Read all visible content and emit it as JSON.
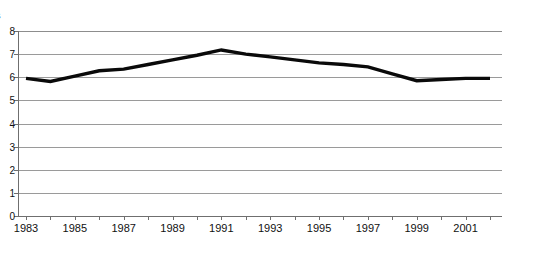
{
  "chart_data": {
    "type": "line",
    "title": "",
    "ylabel": "llions",
    "xlabel": "",
    "grid": true,
    "legend": false,
    "xlim": [
      1983,
      2002
    ],
    "ylim": [
      0,
      8
    ],
    "x": [
      1983,
      1984,
      1985,
      1986,
      1987,
      1988,
      1989,
      1990,
      1991,
      1992,
      1993,
      1994,
      1995,
      1996,
      1997,
      1998,
      1999,
      2000,
      2001,
      2002
    ],
    "xtick_labels": [
      "1983",
      "1985",
      "1987",
      "1989",
      "1991",
      "1993",
      "1995",
      "1997",
      "1999",
      "2001"
    ],
    "xtick_values": [
      1983,
      1985,
      1987,
      1989,
      1991,
      1993,
      1995,
      1997,
      1999,
      2001
    ],
    "ytick_labels": [
      "8",
      "7",
      "6",
      "5",
      "4",
      "3",
      "2",
      "1",
      "0"
    ],
    "ytick_values": [
      8,
      7,
      6,
      5,
      4,
      3,
      2,
      1,
      0
    ],
    "series": [
      {
        "name": "series-1",
        "color": "#0a0a0a",
        "values": [
          5.95,
          5.82,
          6.05,
          6.28,
          6.35,
          6.55,
          6.75,
          6.95,
          7.18,
          7.0,
          6.88,
          6.75,
          6.62,
          6.55,
          6.45,
          6.15,
          5.85,
          5.9,
          5.95,
          5.95
        ]
      }
    ]
  }
}
